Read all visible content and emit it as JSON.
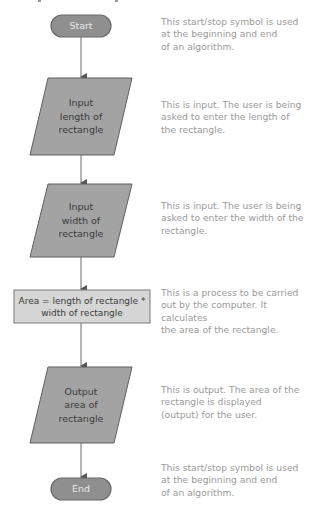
{
  "colors": {
    "terminal_fill": "#8f8f8f",
    "terminal_stroke": "#6b6b6b",
    "io_fill": "#a3a3a3",
    "io_stroke": "#5f5f5f",
    "process_fill": "#d6d6d6",
    "process_stroke": "#7a7a7a",
    "arrow": "#6a6a6a",
    "description_text": "#9a9a9a"
  },
  "flowchart": {
    "nodes": [
      {
        "id": "start",
        "type": "terminal",
        "lines": [
          "Start"
        ]
      },
      {
        "id": "input-length",
        "type": "input",
        "lines": [
          "Input",
          "length of",
          "rectangle"
        ]
      },
      {
        "id": "input-width",
        "type": "input",
        "lines": [
          "Input",
          "width of",
          "rectangle"
        ]
      },
      {
        "id": "process-area",
        "type": "process",
        "lines": [
          "Area = length of rectangle *",
          "width of rectangle"
        ]
      },
      {
        "id": "output-area",
        "type": "output",
        "lines": [
          "Output",
          "area of",
          "rectangle"
        ]
      },
      {
        "id": "end",
        "type": "terminal",
        "lines": [
          "End"
        ]
      }
    ],
    "edges": [
      {
        "from": "start",
        "to": "input-length"
      },
      {
        "from": "input-length",
        "to": "input-width"
      },
      {
        "from": "input-width",
        "to": "process-area"
      },
      {
        "from": "process-area",
        "to": "output-area"
      },
      {
        "from": "output-area",
        "to": "end"
      }
    ]
  },
  "descriptions": {
    "start": "This start/stop symbol is used\nat the beginning and end\nof an algorithm.",
    "input_length": "This is input. The user is being\nasked to enter the length of\nthe rectangle.",
    "input_width": "This is input. The user is being\nasked to enter the width of the\nrectangle.",
    "process_area": "This is a process to be carried\nout by the computer. It calculates\nthe area of the rectangle.",
    "output_area": "This is output. The area of the\nrectangle is displayed\n(output) for the user.",
    "end": "This start/stop symbol is used\nat the beginning and end\nof an algorithm."
  }
}
